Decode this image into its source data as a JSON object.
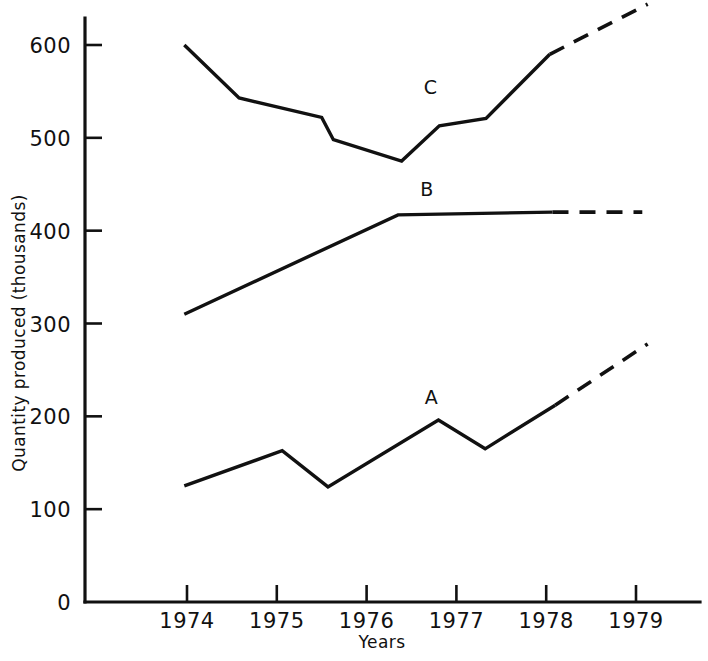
{
  "chart_data": {
    "type": "line",
    "title": "",
    "xlabel": "Years",
    "ylabel": "Quantity produced (thousands)",
    "xlim": [
      1973.78,
      1979.3
    ],
    "ylim": [
      0,
      660
    ],
    "grid": false,
    "legend": "inline-labels",
    "x_tick_labels": [
      "1974",
      "1975",
      "1976",
      "1977",
      "1978",
      "1979"
    ],
    "x_ticks": [
      1974,
      1975,
      1976,
      1977,
      1978,
      1979
    ],
    "y_tick_labels": [
      "0",
      "100",
      "200",
      "300",
      "400",
      "500",
      "600"
    ],
    "y_ticks": [
      0,
      100,
      200,
      300,
      400,
      500,
      600
    ],
    "series": [
      {
        "name": "A",
        "label": "A",
        "label_x": 1976.72,
        "label_y": 213,
        "solid_points": [
          [
            1973.97,
            125
          ],
          [
            1975.06,
            163
          ],
          [
            1975.57,
            124
          ],
          [
            1976.8,
            196
          ],
          [
            1977.32,
            165
          ],
          [
            1978.1,
            212
          ]
        ],
        "dashed_points": [
          [
            1978.1,
            212
          ],
          [
            1979.13,
            278
          ]
        ]
      },
      {
        "name": "B",
        "label": "B",
        "label_x": 1976.67,
        "label_y": 437,
        "solid_points": [
          [
            1973.97,
            310
          ],
          [
            1976.35,
            417
          ],
          [
            1978.07,
            420
          ]
        ],
        "dashed_points": [
          [
            1978.07,
            420
          ],
          [
            1979.07,
            420
          ]
        ]
      },
      {
        "name": "C",
        "label": "C",
        "label_x": 1976.71,
        "label_y": 547,
        "solid_points": [
          [
            1973.97,
            600
          ],
          [
            1974.58,
            543
          ],
          [
            1975.5,
            522
          ],
          [
            1975.63,
            498
          ],
          [
            1976.39,
            475
          ],
          [
            1976.81,
            513
          ],
          [
            1977.33,
            521
          ],
          [
            1978.04,
            590
          ]
        ],
        "dashed_points": [
          [
            1978.04,
            590
          ],
          [
            1979.13,
            644
          ]
        ]
      }
    ]
  },
  "axes": {
    "origin_label": "0"
  }
}
